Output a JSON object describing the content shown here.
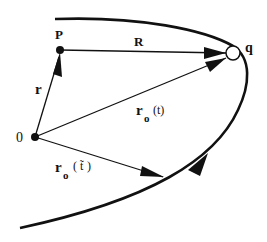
{
  "diagram": {
    "type": "vector-geometry",
    "colors": {
      "ink": "#111111",
      "background": "#ffffff"
    },
    "points": {
      "origin": {
        "label": "0",
        "x": 35,
        "y": 137
      },
      "P": {
        "label": "P",
        "x": 60,
        "y": 50
      },
      "q": {
        "label": "q",
        "x": 233,
        "y": 53
      }
    },
    "vectors": [
      {
        "id": "r",
        "label": "r",
        "from": "origin",
        "to": "P"
      },
      {
        "id": "R",
        "label": "R",
        "from": "P",
        "to": "q"
      },
      {
        "id": "ro_t",
        "label": "r",
        "subscript": "o",
        "argument": "(t)",
        "from": "origin",
        "to": "q"
      },
      {
        "id": "ro_ttilde",
        "label": "r",
        "subscript": "o",
        "argument": "(t̃)",
        "from": "origin",
        "to": "trajectory-point"
      }
    ],
    "trajectory": {
      "description": "curved path passing through q, with direction arrow",
      "direction": "toward q"
    }
  },
  "labels": {
    "origin": "0",
    "P": "P",
    "q": "q",
    "r": "r",
    "R": "R",
    "ro_t_main": "r",
    "ro_t_sub": "o",
    "ro_t_arg": "(t)",
    "ro_tt_main": "r",
    "ro_tt_sub": "o",
    "ro_tt_arg_open": "(",
    "ro_tt_arg_t": "t̃",
    "ro_tt_arg_close": ")"
  }
}
